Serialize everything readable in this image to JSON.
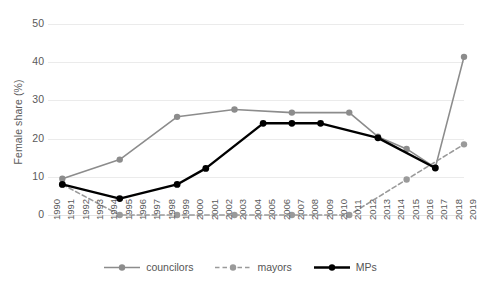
{
  "chart_data": {
    "type": "line",
    "title": "",
    "xlabel": "",
    "ylabel": "Female share (%)",
    "ylim": [
      0,
      50
    ],
    "yticks": [
      0,
      10,
      20,
      30,
      40,
      50
    ],
    "xlim": [
      1990,
      2019
    ],
    "categories": [
      1990,
      1991,
      1992,
      1993,
      1994,
      1995,
      1996,
      1997,
      1998,
      1999,
      2000,
      2001,
      2002,
      2003,
      2004,
      2005,
      2006,
      2007,
      2008,
      2009,
      2010,
      2011,
      2012,
      2013,
      2014,
      2015,
      2016,
      2017,
      2018,
      2019
    ],
    "grid": "horizontal",
    "legend_position": "bottom-center",
    "series": [
      {
        "name": "councilors",
        "color": "#8c8c8c",
        "style": "solid",
        "marker": "circle",
        "x": [
          1991,
          1995,
          1999,
          2003,
          2007,
          2011,
          2013,
          2015,
          2017,
          2019
        ],
        "values": [
          9.5,
          14.5,
          25.7,
          27.6,
          26.8,
          26.8,
          20.5,
          17.3,
          12.4,
          41.4
        ]
      },
      {
        "name": "mayors",
        "color": "#9a9a9a",
        "style": "dashed",
        "marker": "circle",
        "x": [
          1991,
          1995,
          1999,
          2003,
          2007,
          2011,
          2015,
          2019
        ],
        "values": [
          8.0,
          0.0,
          0.0,
          0.0,
          0.0,
          0.0,
          9.3,
          18.5
        ]
      },
      {
        "name": "MPs",
        "color": "#000000",
        "style": "solid",
        "marker": "circle",
        "x": [
          1991,
          1995,
          1999,
          2001,
          2005,
          2007,
          2009,
          2013,
          2017
        ],
        "values": [
          8.0,
          4.3,
          8.0,
          12.2,
          24.0,
          24.0,
          24.0,
          20.2,
          12.3
        ]
      }
    ]
  },
  "axis": {
    "y_title": "Female share (%)",
    "y_ticks": [
      "0",
      "10",
      "20",
      "30",
      "40",
      "50"
    ],
    "x_ticks": [
      "1990",
      "1991",
      "1992",
      "1993",
      "1994",
      "1995",
      "1996",
      "1997",
      "1998",
      "1999",
      "2000",
      "2001",
      "2002",
      "2003",
      "2004",
      "2005",
      "2006",
      "2007",
      "2008",
      "2009",
      "2010",
      "2011",
      "2012",
      "2013",
      "2014",
      "2015",
      "2016",
      "2017",
      "2018",
      "2019"
    ]
  },
  "legend": {
    "items": [
      {
        "label": "councilors",
        "color": "#8c8c8c",
        "style": "solid"
      },
      {
        "label": "mayors",
        "color": "#9a9a9a",
        "style": "dashed"
      },
      {
        "label": "MPs",
        "color": "#000000",
        "style": "solid"
      }
    ]
  },
  "colors": {
    "gridline": "#ebebeb",
    "councilors": "#8c8c8c",
    "mayors": "#9a9a9a",
    "mps": "#000000",
    "text": "#5a5a5a",
    "background": "#ffffff"
  }
}
